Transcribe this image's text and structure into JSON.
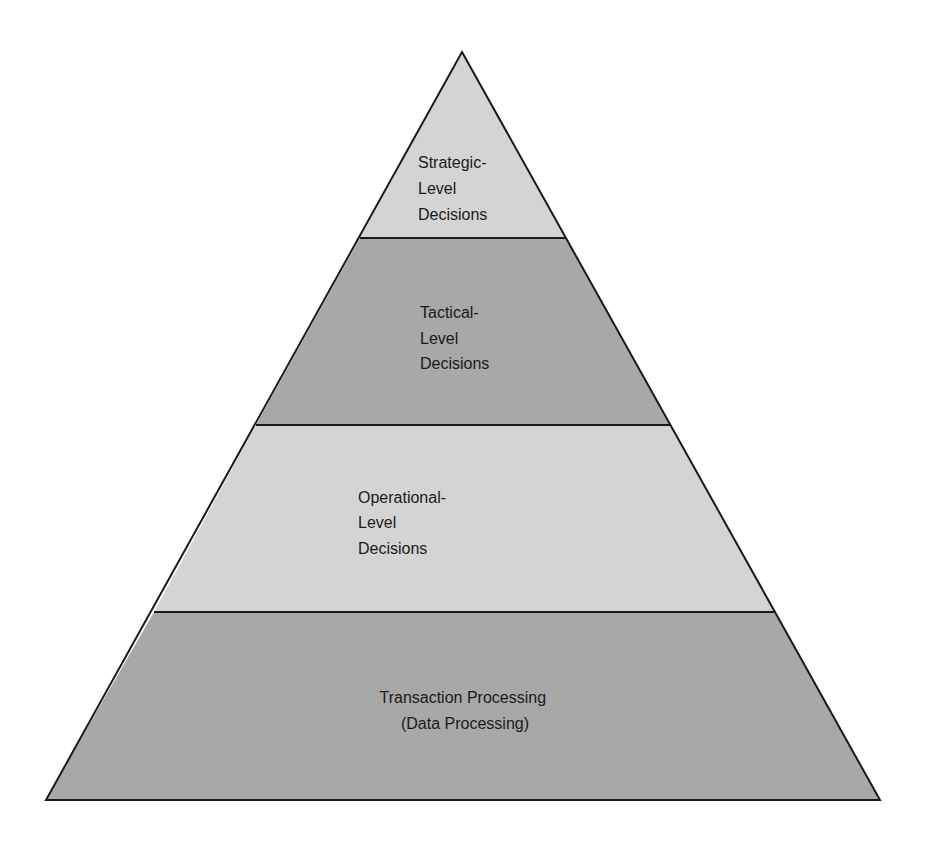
{
  "diagram": {
    "type": "pyramid",
    "colors": {
      "light_fill": "#d4d4d4",
      "dark_fill": "#a8a8a8",
      "stroke": "#1a1a1a",
      "text": "#1a1a1a"
    },
    "tiers": [
      {
        "name": "strategic",
        "lines": [
          "Strategic-",
          "Level",
          "Decisions"
        ],
        "align": "left"
      },
      {
        "name": "tactical",
        "lines": [
          "Tactical-",
          "Level",
          "Decisions"
        ],
        "align": "left"
      },
      {
        "name": "operational",
        "lines": [
          "Operational-",
          "Level",
          "Decisions"
        ],
        "align": "left"
      },
      {
        "name": "transaction",
        "lines": [
          "Transaction Processing",
          "(Data Processing)"
        ],
        "align": "center"
      }
    ]
  }
}
